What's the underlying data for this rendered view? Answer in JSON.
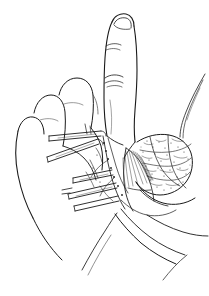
{
  "figure": {
    "kind": "line-art-medical-illustration",
    "caption": "",
    "background_color": "#ffffff",
    "ink_color": "#1a1a1a",
    "soft_ink_color": "#4a4a4a",
    "canvas": {
      "width": 209,
      "height": 296
    },
    "has_text_labels": false,
    "has_axis": false,
    "has_legend": false,
    "style": "pen-and-ink stipple and hatching, black on white, no shading tones"
  },
  "anatomy": {
    "hand": {
      "name": "hand",
      "view": "dorsolateral / palmar-radial oblique",
      "description": "right hand with index finger held extended upward and remaining fingers flexed toward the palm"
    },
    "parts": [
      {
        "id": "index-finger",
        "label": "index finger",
        "state": "extended vertically",
        "features": [
          "fingernail",
          "distal interphalangeal crease",
          "proximal interphalangeal crease"
        ]
      },
      {
        "id": "middle-finger",
        "label": "middle finger",
        "state": "flexed"
      },
      {
        "id": "ring-finger",
        "label": "ring finger",
        "state": "flexed"
      },
      {
        "id": "little-finger",
        "label": "little finger",
        "state": "flexed"
      },
      {
        "id": "thumb-web",
        "label": "thumb web space",
        "state": "open"
      },
      {
        "id": "palm",
        "label": "palm",
        "state": "partially visible"
      },
      {
        "id": "fibrous-mass",
        "label": "lobulated fibrous tissue mass",
        "texture": "dense stipple and scribble"
      },
      {
        "id": "aponeurosis",
        "label": "palmar aponeurosis with radiating fibres",
        "texture": "fine fan-shaped parallel hatching"
      },
      {
        "id": "neurovascular-bundle",
        "label": "neurovascular bundle / cord",
        "texture": "beaded irregular line"
      },
      {
        "id": "skin-flap",
        "label": "reflected skin flap",
        "texture": "outline only"
      },
      {
        "id": "suture-strands",
        "label": "suture or tendon strands",
        "location": "upper right"
      }
    ]
  },
  "instruments": {
    "label": "surgical instruments in field",
    "count": 5,
    "items": [
      {
        "id": "retractor-upper-1",
        "label": "fine retractor / forceps blade",
        "orientation": "from left, angled up-right"
      },
      {
        "id": "retractor-upper-2",
        "label": "fine retractor / forceps blade",
        "orientation": "from left, angled right"
      },
      {
        "id": "retractor-mid",
        "label": "skin hook / forceps",
        "orientation": "from lower left, angled up-right"
      },
      {
        "id": "retractor-lower-1",
        "label": "retractor blade",
        "orientation": "from lower left, angled right"
      },
      {
        "id": "retractor-lower-2",
        "label": "retractor blade",
        "orientation": "from lower left, shallow angle"
      }
    ]
  },
  "annotations": {
    "leader_lines": [],
    "numbers": [],
    "letters": []
  }
}
